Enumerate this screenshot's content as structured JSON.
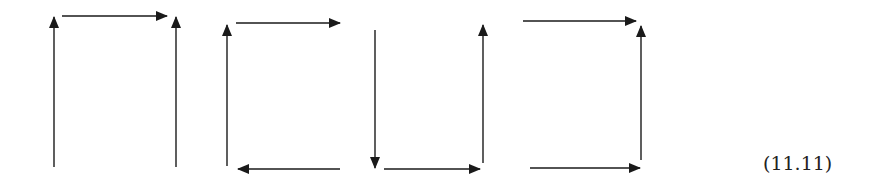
{
  "equation_label": "(11.11)",
  "colors": {
    "stroke": "#1a1a1a",
    "background": "#ffffff"
  },
  "diagrams": [
    {
      "name": "diagram-1",
      "arrows": [
        {
          "name": "left-up-arrow",
          "x1": 54,
          "y1": 167,
          "x2": 54,
          "y2": 17
        },
        {
          "name": "top-right-arrow",
          "x1": 62,
          "y1": 16,
          "x2": 167,
          "y2": 16
        },
        {
          "name": "right-up-arrow",
          "x1": 176,
          "y1": 167,
          "x2": 176,
          "y2": 17
        }
      ]
    },
    {
      "name": "diagram-2",
      "arrows": [
        {
          "name": "left-up-arrow",
          "x1": 227,
          "y1": 166,
          "x2": 227,
          "y2": 25
        },
        {
          "name": "top-right-arrow",
          "x1": 236,
          "y1": 23,
          "x2": 340,
          "y2": 23
        },
        {
          "name": "right-down-arrow",
          "x1": 375,
          "y1": 30,
          "x2": 375,
          "y2": 168
        },
        {
          "name": "bottom-left-arrow",
          "x1": 340,
          "y1": 169,
          "x2": 238,
          "y2": 169
        }
      ]
    },
    {
      "name": "diagram-3",
      "arrows": [
        {
          "name": "bottom-right-arrow",
          "x1": 384,
          "y1": 169,
          "x2": 480,
          "y2": 169
        },
        {
          "name": "right-up-arrow",
          "x1": 483,
          "y1": 163,
          "x2": 483,
          "y2": 25
        }
      ]
    },
    {
      "name": "diagram-4",
      "arrows": [
        {
          "name": "top-right-arrow",
          "x1": 523,
          "y1": 21,
          "x2": 636,
          "y2": 21
        },
        {
          "name": "right-up-arrow",
          "x1": 641,
          "y1": 160,
          "x2": 641,
          "y2": 26
        },
        {
          "name": "bottom-right-arrow",
          "x1": 530,
          "y1": 168,
          "x2": 640,
          "y2": 168
        }
      ]
    }
  ]
}
